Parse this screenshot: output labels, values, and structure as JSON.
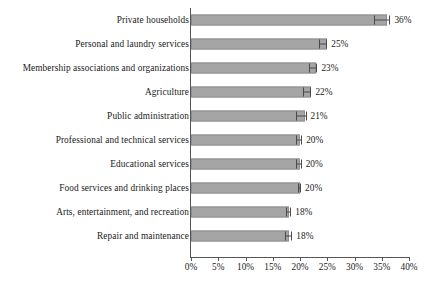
{
  "chart_data": {
    "type": "bar",
    "orientation": "horizontal",
    "title": "",
    "subtitle": "",
    "xlabel": "",
    "ylabel": "",
    "xlim": [
      0,
      40
    ],
    "xtick_labels": [
      "0%",
      "5%",
      "10%",
      "15%",
      "20%",
      "25%",
      "30%",
      "35%",
      "40%"
    ],
    "xtick_values": [
      0,
      5,
      10,
      15,
      20,
      25,
      30,
      35,
      40
    ],
    "grid": false,
    "legend": null,
    "value_suffix": "%",
    "categories": [
      "Private households",
      "Personal and laundry services",
      "Membership associations and organizations",
      "Agriculture",
      "Public administration",
      "Professional and technical services",
      "Educational services",
      "Food services and drinking places",
      "Arts, entertainment, and recreation",
      "Repair and maintenance"
    ],
    "values": [
      36,
      25,
      23,
      22,
      21,
      20,
      20,
      20,
      18,
      18
    ],
    "value_labels": [
      "36%",
      "25%",
      "23%",
      "22%",
      "21%",
      "20%",
      "20%",
      "20%",
      "18%",
      "18%"
    ],
    "error_bars": [
      {
        "low": 33.6,
        "high": 36.6
      },
      {
        "low": 23.4,
        "high": 25.0
      },
      {
        "low": 21.6,
        "high": 23.2
      },
      {
        "low": 20.6,
        "high": 22.1
      },
      {
        "low": 19.2,
        "high": 21.2
      },
      {
        "low": 19.2,
        "high": 20.4
      },
      {
        "low": 19.3,
        "high": 20.3
      },
      {
        "low": 19.6,
        "high": 20.2
      },
      {
        "low": 17.5,
        "high": 18.4
      },
      {
        "low": 17.2,
        "high": 18.6
      }
    ],
    "colors": {
      "bar_fill": "#a5a5a5",
      "bar_stroke": "#8e8e8e",
      "error_bar": "#4a4a4a",
      "axis": "#555555",
      "text": "#1a1a1a",
      "background": "#ffffff"
    }
  }
}
